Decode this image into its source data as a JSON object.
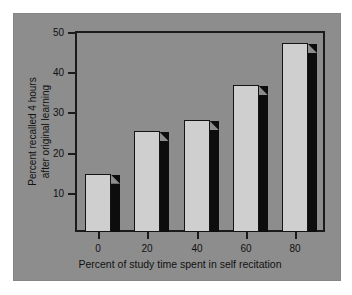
{
  "figure": {
    "background_color": "#ffffff",
    "panel_color": "#8d8d8d",
    "axis_color": "#1b1b1b",
    "bar_face_color": "#cfcfcf",
    "bar_shadow_color": "#0d0d0d"
  },
  "chart_data": {
    "type": "bar",
    "title": "",
    "subtitle": "",
    "xlabel": "Percent of study time spent in self recitation",
    "ylabel": "Percent recalled 4 hours after original learning",
    "ylabel_line1": "Percent recalled 4 hours",
    "ylabel_line2": "after original learning",
    "categories": [
      "0",
      "20",
      "40",
      "60",
      "80"
    ],
    "values": [
      15,
      25.5,
      28.3,
      37,
      47.5
    ],
    "ylim": [
      0.5,
      50
    ],
    "yticks": [
      10,
      20,
      30,
      40,
      50
    ],
    "ytick_labels": [
      "10",
      "20",
      "30",
      "40",
      "50"
    ],
    "xticks": [
      0,
      20,
      40,
      60,
      80
    ],
    "xtick_labels": [
      "0",
      "20",
      "40",
      "60",
      "80"
    ],
    "grid": false,
    "legend": null,
    "legend_position": "none",
    "annotations": [],
    "bar_style": "3d-shadowed"
  }
}
